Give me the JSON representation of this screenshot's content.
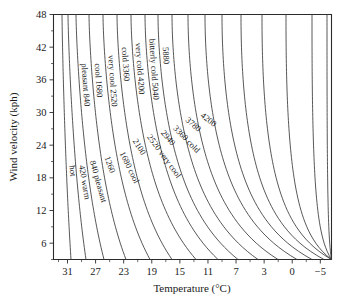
{
  "chart_data": {
    "type": "line",
    "title": "",
    "xlabel": "Temperature (°C)",
    "ylabel": "Wind velocity (kph)",
    "xlim": [
      33,
      -5
    ],
    "ylim": [
      3,
      48
    ],
    "grid": false,
    "legend_position": "none",
    "note": "Wind-chill nomogram: each curve is a constant wind-chill index contour labelled with its index value and comfort descriptor.",
    "x_ticks": [
      "31",
      "27",
      "23",
      "19",
      "15",
      "11",
      "7",
      "3",
      "0",
      "−5"
    ],
    "x_tick_values": [
      31,
      27,
      23,
      19,
      15,
      11,
      7,
      3,
      0,
      -5
    ],
    "x_minor_ticks": true,
    "y_ticks": [
      "6",
      "12",
      "18",
      "24",
      "30",
      "36",
      "42",
      "48"
    ],
    "y_tick_values": [
      6,
      12,
      18,
      24,
      30,
      36,
      42,
      48
    ],
    "y_minor_ticks": true,
    "contour_step": 420,
    "contours": [
      {
        "value": 0,
        "label": "hot",
        "descriptor": "hot"
      },
      {
        "value": 420,
        "label": "420 warm",
        "descriptor": "warm"
      },
      {
        "value": 840,
        "label": "840 pleasant",
        "descriptor": "pleasant"
      },
      {
        "value": 840,
        "label": "pleasant 840",
        "descriptor": "pleasant"
      },
      {
        "value": 1260,
        "label": "1260",
        "descriptor": ""
      },
      {
        "value": 1680,
        "label": "1680 cool",
        "descriptor": "cool"
      },
      {
        "value": 1680,
        "label": "cool 1680",
        "descriptor": "cool"
      },
      {
        "value": 2100,
        "label": "2100",
        "descriptor": ""
      },
      {
        "value": 2520,
        "label": "2520 very cool",
        "descriptor": "very cool"
      },
      {
        "value": 2520,
        "label": "very cool 2520",
        "descriptor": "very cool"
      },
      {
        "value": 2940,
        "label": "2940",
        "descriptor": ""
      },
      {
        "value": 3360,
        "label": "3360 cold",
        "descriptor": "cold"
      },
      {
        "value": 3360,
        "label": "cold 3360",
        "descriptor": "cold"
      },
      {
        "value": 3780,
        "label": "3780",
        "descriptor": ""
      },
      {
        "value": 4200,
        "label": "4200",
        "descriptor": ""
      },
      {
        "value": 4200,
        "label": "very cold 4200",
        "descriptor": "very cold"
      },
      {
        "value": 5040,
        "label": "bitterly cold 5040",
        "descriptor": "bitterly cold"
      },
      {
        "value": 5880,
        "label": "5880",
        "descriptor": ""
      }
    ],
    "curve_labels_upper": [
      "pleasant 840",
      "cool 1680",
      "very cool 2520",
      "cold 3360",
      "very cold 4200",
      "bitterly cold 5040",
      "5880"
    ],
    "curve_labels_lower": [
      "hot",
      "420 warm",
      "840 pleasant",
      "1260",
      "1680 cool",
      "2100",
      "2520 very cool",
      "2940",
      "3360 cold",
      "3780",
      "4200"
    ]
  },
  "axes": {
    "x_title": "Temperature (°C)",
    "y_title": "Wind velocity (kph)"
  },
  "colors": {
    "ink": "#1a1a1a",
    "curve": "#3a3a3a",
    "background": "#ffffff"
  }
}
